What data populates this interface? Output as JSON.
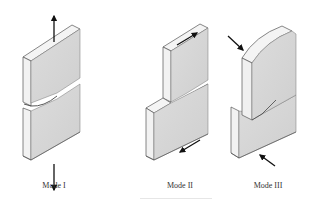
{
  "figure": {
    "panels": [
      {
        "id": "mode-1",
        "label": "Mode I",
        "description": "Opening mode: tensile loads perpendicular to crack plane",
        "arrows": [
          "up",
          "down"
        ]
      },
      {
        "id": "mode-2",
        "label": "Mode II",
        "description": "Sliding mode: in-plane shear",
        "arrows": [
          "top-forward",
          "bottom-backward"
        ]
      },
      {
        "id": "mode-3",
        "label": "Mode III",
        "description": "Tearing mode: out-of-plane shear",
        "arrows": [
          "top-inward",
          "bottom-inward"
        ]
      }
    ],
    "colors": {
      "face_front": "#d7d7d7",
      "face_side": "#f0f0f0",
      "edge": "#555555",
      "arrow": "#111111",
      "background": "#ffffff"
    }
  }
}
